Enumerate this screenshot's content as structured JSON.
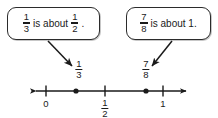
{
  "diagram": {
    "line_color": "#1a1a1a",
    "box_border_color": "#2b2b2b",
    "background": "#ffffff"
  },
  "callouts": [
    {
      "id": "callout-a",
      "fraction_1": {
        "numerator": "1",
        "denominator": "3"
      },
      "text_middle": "is about",
      "fraction_2": {
        "numerator": "1",
        "denominator": "2"
      },
      "text_end": "."
    },
    {
      "id": "callout-b",
      "fraction_1": {
        "numerator": "7",
        "denominator": "8"
      },
      "text_middle": "is about 1."
    }
  ],
  "number_line": {
    "ticks": [
      {
        "label": "0",
        "position": 0
      },
      {
        "label_numerator": "1",
        "label_denominator": "2",
        "position": 0.5
      },
      {
        "label": "1",
        "position": 1
      }
    ],
    "points": [
      {
        "numerator": "1",
        "denominator": "3",
        "position": 0.3333
      },
      {
        "numerator": "7",
        "denominator": "8",
        "position": 0.875
      }
    ]
  }
}
